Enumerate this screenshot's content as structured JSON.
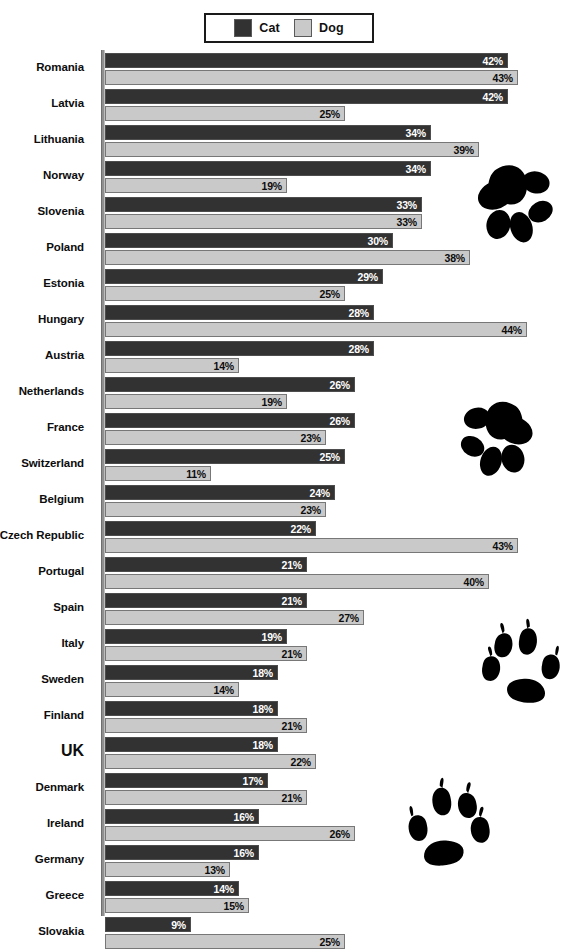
{
  "legend": {
    "entries": [
      {
        "label": "Cat",
        "color": "#333233",
        "key": "cat"
      },
      {
        "label": "Dog",
        "color": "#c9c9c9",
        "key": "dog"
      }
    ]
  },
  "chart_data": {
    "type": "bar",
    "orientation": "horizontal",
    "title": "",
    "xlabel": "",
    "ylabel": "",
    "xlim": [
      0,
      44
    ],
    "grid": false,
    "legend_position": "top-center",
    "value_suffix": "%",
    "categories": [
      "Romania",
      "Latvia",
      "Lithuania",
      "Norway",
      "Slovenia",
      "Poland",
      "Estonia",
      "Hungary",
      "Austria",
      "Netherlands",
      "France",
      "Switzerland",
      "Belgium",
      "Czech Republic",
      "Portugal",
      "Spain",
      "Italy",
      "Sweden",
      "Finland",
      "UK",
      "Denmark",
      "Ireland",
      "Germany",
      "Greece",
      "Slovakia"
    ],
    "series": [
      {
        "name": "Cat",
        "color": "#333233",
        "values": [
          42,
          42,
          34,
          34,
          33,
          30,
          29,
          28,
          28,
          26,
          26,
          25,
          24,
          22,
          21,
          21,
          19,
          18,
          18,
          18,
          17,
          16,
          16,
          14,
          9
        ],
        "labels": [
          "42%",
          "42%",
          "34%",
          "34%",
          "33%",
          "30%",
          "29%",
          "28%",
          "28%",
          "26%",
          "26%",
          "25%",
          "24%",
          "22%",
          "21%",
          "21%",
          "19%",
          "18%",
          "18%",
          "18%",
          "17%",
          "16%",
          "16%",
          "14%",
          "9%"
        ]
      },
      {
        "name": "Dog",
        "color": "#c9c9c9",
        "values": [
          43,
          25,
          39,
          19,
          33,
          38,
          25,
          44,
          14,
          19,
          23,
          11,
          23,
          43,
          40,
          27,
          21,
          14,
          21,
          22,
          21,
          26,
          13,
          15,
          25
        ],
        "labels": [
          "43%",
          "25%",
          "39%",
          "19%",
          "33%",
          "38%",
          "25%",
          "44%",
          "14%",
          "19%",
          "23%",
          "11%",
          "23%",
          "43%",
          "40%",
          "27%",
          "21%",
          "14%",
          "21%",
          "22%",
          "21%",
          "26%",
          "13%",
          "15%",
          "25%"
        ]
      }
    ],
    "highlighted_category": "UK"
  },
  "decorations": [
    {
      "name": "cat-paw-print",
      "type": "cat",
      "x": 466,
      "y": 155,
      "size": 96,
      "flip": false
    },
    {
      "name": "cat-paw-print",
      "type": "cat",
      "x": 452,
      "y": 392,
      "size": 92,
      "flip": true
    },
    {
      "name": "dog-paw-print",
      "type": "dog",
      "x": 476,
      "y": 616,
      "size": 92,
      "flip": false
    },
    {
      "name": "dog-paw-print",
      "type": "dog",
      "x": 400,
      "y": 775,
      "size": 96,
      "flip": true
    }
  ]
}
